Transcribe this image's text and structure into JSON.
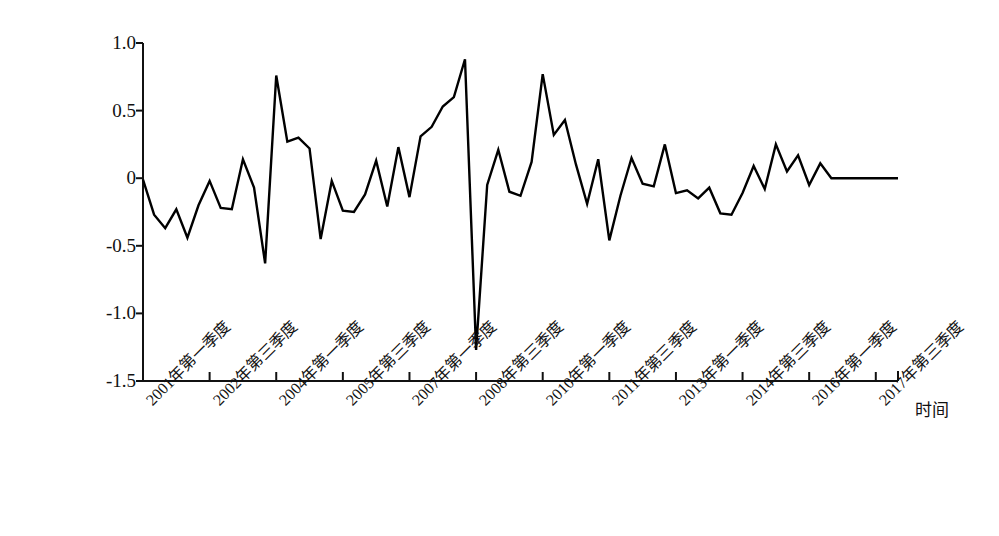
{
  "chart_data": {
    "type": "line",
    "title": "",
    "subtitle": "",
    "xlabel": "时间",
    "ylabel": "",
    "ylim": [
      -1.5,
      1.0
    ],
    "ytick_values": [
      1.0,
      0.5,
      0,
      -0.5,
      -1.0,
      -1.5
    ],
    "ytick_labels": [
      "1.0",
      "0.5",
      "0",
      "-0.5",
      "-1.0",
      "-1.5"
    ],
    "grid": false,
    "legend": null,
    "legend_position": "none",
    "line_color": "#000000",
    "line_width": 2.4,
    "markers": false,
    "xtick_labels": [
      "2001年第一季度",
      "2002年第三季度",
      "2004年第一季度",
      "2005年第三季度",
      "2007年第一季度",
      "2008年第三季度",
      "2010年第一季度",
      "2011年第三季度",
      "2013年第一季度",
      "2014年第三季度",
      "2016年第一季度",
      "2017年第三季度"
    ],
    "xtick_indices": [
      0,
      6,
      12,
      18,
      24,
      30,
      36,
      42,
      48,
      54,
      60,
      66
    ],
    "x": [
      "2001Q1",
      "2001Q2",
      "2001Q3",
      "2001Q4",
      "2002Q1",
      "2002Q2",
      "2002Q3",
      "2002Q4",
      "2003Q1",
      "2003Q2",
      "2003Q3",
      "2003Q4",
      "2004Q1",
      "2004Q2",
      "2004Q3",
      "2004Q4",
      "2005Q1",
      "2005Q2",
      "2005Q3",
      "2005Q4",
      "2006Q1",
      "2006Q2",
      "2006Q3",
      "2006Q4",
      "2007Q1",
      "2007Q2",
      "2007Q3",
      "2007Q4",
      "2008Q1",
      "2008Q2",
      "2008Q3",
      "2008Q4",
      "2009Q1",
      "2009Q2",
      "2009Q3",
      "2009Q4",
      "2010Q1",
      "2010Q2",
      "2010Q3",
      "2010Q4",
      "2011Q1",
      "2011Q2",
      "2011Q3",
      "2011Q4",
      "2012Q1",
      "2012Q2",
      "2012Q3",
      "2012Q4",
      "2013Q1",
      "2013Q2",
      "2013Q3",
      "2013Q4",
      "2014Q1",
      "2014Q2",
      "2014Q3",
      "2014Q4",
      "2015Q1",
      "2015Q2",
      "2015Q3",
      "2015Q4",
      "2016Q1",
      "2016Q2",
      "2016Q3",
      "2016Q4",
      "2017Q1",
      "2017Q2",
      "2017Q3",
      "2017Q4",
      "2018Q1"
    ],
    "values": [
      -0.01,
      -0.27,
      -0.37,
      -0.23,
      -0.44,
      -0.2,
      -0.02,
      -0.22,
      -0.23,
      0.14,
      -0.07,
      -0.63,
      0.76,
      0.27,
      0.3,
      0.22,
      -0.45,
      -0.02,
      -0.24,
      -0.25,
      -0.12,
      0.13,
      -0.21,
      0.23,
      -0.14,
      0.31,
      0.38,
      0.53,
      0.6,
      0.88,
      -1.27,
      -0.05,
      0.21,
      -0.1,
      -0.13,
      0.12,
      0.77,
      0.32,
      0.43,
      0.1,
      -0.19,
      0.14,
      -0.46,
      -0.13,
      0.15,
      -0.04,
      -0.06,
      0.25,
      -0.11,
      -0.09,
      -0.15,
      -0.07,
      -0.26,
      -0.27,
      -0.11,
      0.09,
      -0.08,
      0.25,
      0.05,
      0.17,
      -0.05,
      0.11,
      0.0,
      0.0,
      0.0,
      0.0,
      0.0,
      0.0,
      0.0
    ],
    "plot_geometry": {
      "axis_left_px": 143,
      "axis_right_px": 898,
      "axis_top_px": 43,
      "axis_bottom_px": 381,
      "first_point_px": 143,
      "last_point_px": 898
    }
  },
  "axes": {
    "y_axis_name": "value-axis",
    "x_axis_name": "time-axis"
  }
}
